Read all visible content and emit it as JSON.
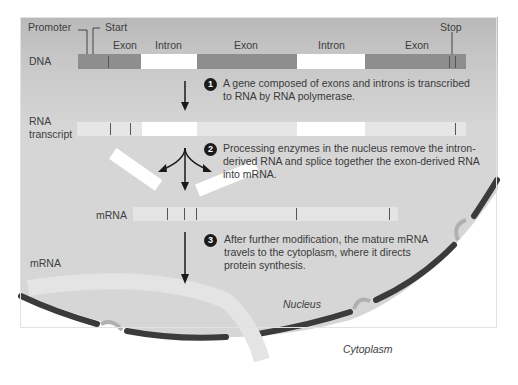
{
  "dna_row": {
    "label": "DNA",
    "promoter_label": "Promoter",
    "start_label": "Start",
    "stop_label": "Stop",
    "segments": [
      {
        "type": "Exon",
        "label": "Exon"
      },
      {
        "type": "Intron",
        "label": "Intron"
      },
      {
        "type": "Exon",
        "label": "Exon"
      },
      {
        "type": "Intron",
        "label": "Intron"
      },
      {
        "type": "Exon",
        "label": "Exon"
      }
    ]
  },
  "rna_row": {
    "label_line1": "RNA",
    "label_line2": "transcript"
  },
  "mrna_row": {
    "label": "mRNA"
  },
  "cytoplasm_mrna_label": "mRNA",
  "steps": [
    {
      "number": "1",
      "text": "A gene composed of exons and introns is transcribed to RNA  by RNA polymerase."
    },
    {
      "number": "2",
      "text": "Processing enzymes in the nucleus remove the intron-derived RNA and splice together the exon-derived RNA into mRNA."
    },
    {
      "number": "3",
      "text": "After further modification, the mature mRNA travels to the cytoplasm, where it directs protein synthesis."
    }
  ],
  "regions": {
    "nucleus": "Nucleus",
    "cytoplasm": "Cytoplasm"
  },
  "colors": {
    "exon_dna": "#8e8e8e",
    "intron": "#ffffff",
    "exon_rna": "#e6e6e6",
    "membrane": "#3a3a3a",
    "nucleus_fill": "#d8d8d8"
  }
}
